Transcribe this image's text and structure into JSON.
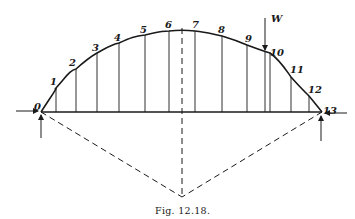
{
  "figure": {
    "caption": "Fig. 12.18.",
    "load_label": "W",
    "point_labels": [
      "0",
      "1",
      "2",
      "3",
      "4",
      "5",
      "6",
      "7",
      "8",
      "9",
      "10",
      "11",
      "12",
      "13"
    ],
    "colors": {
      "ink": "#1a1a1a",
      "background": "#ffffff"
    }
  }
}
